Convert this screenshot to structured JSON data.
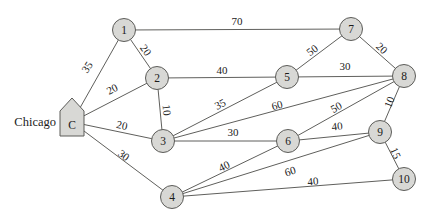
{
  "canvas": {
    "width": 435,
    "height": 222,
    "background": "#ffffff"
  },
  "colors": {
    "node_fill": "#d8d8d5",
    "node_stroke": "#5c5c59",
    "edge": "#5f5f5c",
    "text": "#1b1b1b"
  },
  "graph": {
    "type": "weighted-undirected-network",
    "source_city_label": {
      "text": "Chicago",
      "x": 56,
      "y": 122
    },
    "nodes": [
      {
        "id": "C",
        "label": "C",
        "x": 72,
        "y": 122,
        "shape": "pentagon"
      },
      {
        "id": "1",
        "label": "1",
        "x": 124,
        "y": 30,
        "shape": "circle"
      },
      {
        "id": "2",
        "label": "2",
        "x": 157,
        "y": 78,
        "shape": "circle"
      },
      {
        "id": "3",
        "label": "3",
        "x": 163,
        "y": 141,
        "shape": "circle"
      },
      {
        "id": "4",
        "label": "4",
        "x": 172,
        "y": 197,
        "shape": "circle"
      },
      {
        "id": "5",
        "label": "5",
        "x": 287,
        "y": 77,
        "shape": "circle"
      },
      {
        "id": "6",
        "label": "6",
        "x": 288,
        "y": 141,
        "shape": "circle"
      },
      {
        "id": "7",
        "label": "7",
        "x": 351,
        "y": 29,
        "shape": "circle"
      },
      {
        "id": "8",
        "label": "8",
        "x": 404,
        "y": 76,
        "shape": "circle"
      },
      {
        "id": "9",
        "label": "9",
        "x": 380,
        "y": 132,
        "shape": "circle"
      },
      {
        "id": "10",
        "label": "10",
        "x": 404,
        "y": 179,
        "shape": "circle"
      }
    ],
    "edges": [
      {
        "from": "C",
        "to": "1",
        "weight": "35",
        "lx": 87,
        "ly": 67,
        "rot": -57
      },
      {
        "from": "C",
        "to": "2",
        "weight": "20",
        "lx": 112,
        "ly": 89,
        "rot": -27
      },
      {
        "from": "C",
        "to": "3",
        "weight": "20",
        "lx": 122,
        "ly": 125,
        "rot": 12
      },
      {
        "from": "C",
        "to": "4",
        "weight": "30",
        "lx": 124,
        "ly": 155,
        "rot": 37
      },
      {
        "from": "1",
        "to": "2",
        "weight": "20",
        "lx": 146,
        "ly": 50,
        "rot": 55
      },
      {
        "from": "1",
        "to": "7",
        "weight": "70",
        "lx": 237,
        "ly": 21,
        "rot": 0
      },
      {
        "from": "2",
        "to": "3",
        "weight": "10",
        "lx": 167,
        "ly": 110,
        "rot": 84
      },
      {
        "from": "2",
        "to": "5",
        "weight": "40",
        "lx": 222,
        "ly": 70,
        "rot": 0
      },
      {
        "from": "3",
        "to": "5",
        "weight": "35",
        "lx": 220,
        "ly": 104,
        "rot": -27
      },
      {
        "from": "3",
        "to": "6",
        "weight": "30",
        "lx": 233,
        "ly": 132,
        "rot": 0
      },
      {
        "from": "3",
        "to": "8",
        "weight": "60",
        "lx": 277,
        "ly": 105,
        "rot": -15
      },
      {
        "from": "4",
        "to": "6",
        "weight": "40",
        "lx": 224,
        "ly": 166,
        "rot": -26
      },
      {
        "from": "4",
        "to": "9",
        "weight": "60",
        "lx": 290,
        "ly": 171,
        "rot": -17
      },
      {
        "from": "4",
        "to": "10",
        "weight": "40",
        "lx": 313,
        "ly": 181,
        "rot": -5
      },
      {
        "from": "5",
        "to": "7",
        "weight": "50",
        "lx": 312,
        "ly": 50,
        "rot": -37
      },
      {
        "from": "5",
        "to": "8",
        "weight": "30",
        "lx": 345,
        "ly": 66,
        "rot": 0
      },
      {
        "from": "6",
        "to": "8",
        "weight": "50",
        "lx": 336,
        "ly": 107,
        "rot": -29
      },
      {
        "from": "6",
        "to": "9",
        "weight": "40",
        "lx": 337,
        "ly": 126,
        "rot": -6
      },
      {
        "from": "7",
        "to": "8",
        "weight": "20",
        "lx": 382,
        "ly": 48,
        "rot": 42
      },
      {
        "from": "8",
        "to": "9",
        "weight": "10",
        "lx": 389,
        "ly": 102,
        "rot": -68
      },
      {
        "from": "9",
        "to": "10",
        "weight": "15",
        "lx": 396,
        "ly": 153,
        "rot": 66
      }
    ]
  }
}
